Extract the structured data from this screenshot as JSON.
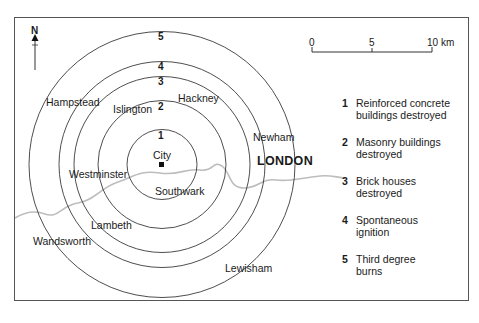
{
  "map": {
    "title": "LONDON",
    "north_label": "N",
    "center_marker": "City",
    "rings": [
      {
        "number": "1",
        "label": "Reinforced concrete buildings destroyed",
        "radius_px": 35
      },
      {
        "number": "2",
        "label": "Masonry buildings destroyed",
        "radius_px": 64
      },
      {
        "number": "3",
        "label": "Brick houses destroyed",
        "radius_px": 88
      },
      {
        "number": "4",
        "label": "Spontaneous ignition",
        "radius_px": 103
      },
      {
        "number": "5",
        "label": "Third degree burns",
        "radius_px": 133
      }
    ],
    "places": {
      "city": "City",
      "hampstead": "Hampstead",
      "islington": "Islington",
      "hackney": "Hackney",
      "newham": "Newham",
      "westminster": "Westminster",
      "southwark": "Southwark",
      "lambeth": "Lambeth",
      "wandsworth": "Wandsworth",
      "lewisham": "Lewisham"
    },
    "scale": {
      "ticks": [
        "0",
        "5",
        "10 km"
      ]
    },
    "legend": [
      {
        "number": "1",
        "line1": "Reinforced concrete",
        "line2": "buildings destroyed"
      },
      {
        "number": "2",
        "line1": "Masonry buildings",
        "line2": "destroyed"
      },
      {
        "number": "3",
        "line1": "Brick houses",
        "line2": "destroyed"
      },
      {
        "number": "4",
        "line1": "Spontaneous",
        "line2": "ignition"
      },
      {
        "number": "5",
        "line1": "Third degree",
        "line2": "burns"
      }
    ],
    "colors": {
      "rings": "#3a3a3a",
      "river": "#b8b8b8",
      "frame": "#555555"
    }
  }
}
